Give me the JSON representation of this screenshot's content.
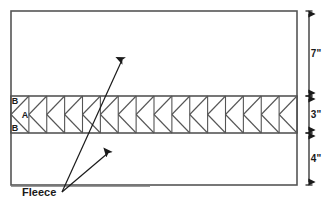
{
  "diagram": {
    "panel": {
      "name": "fabric-panel",
      "left": 11,
      "top": 11,
      "right": 297,
      "bottom": 185,
      "stroke_color": "#555555",
      "fill_color": "#ffffff"
    },
    "band": {
      "name": "zigzag-band",
      "top": 96,
      "bottom": 133,
      "cell_count": 16,
      "stroke_color": "#555555"
    },
    "section_labels": [
      {
        "text": "B",
        "x": 15,
        "y": 104
      },
      {
        "text": "A",
        "x": 25,
        "y": 118
      },
      {
        "text": "B",
        "x": 15,
        "y": 131
      }
    ],
    "dimensions": {
      "line_x": 309,
      "stroke_color": "#1a1a1a",
      "entries": [
        {
          "label": "7\"",
          "top": 11,
          "bottom": 96,
          "text_x": 316,
          "text_y": 57
        },
        {
          "label": "3\"",
          "top": 96,
          "bottom": 133,
          "text_x": 316,
          "text_y": 118
        },
        {
          "label": "4\"",
          "top": 133,
          "bottom": 185,
          "text_x": 316,
          "text_y": 162
        }
      ]
    },
    "callout": {
      "label": "Fleece",
      "text_x": 22,
      "text_y": 196,
      "origin_x": 62,
      "origin_y": 192,
      "underline": {
        "x1": 11,
        "y1": 186,
        "x2": 150,
        "y2": 186
      },
      "leaders": [
        {
          "name": "leader-to-upper-band",
          "x2": 122,
          "y2": 60
        },
        {
          "name": "leader-to-lower-panel",
          "x2": 108,
          "y2": 153
        }
      ],
      "stroke_color": "#1a1a1a"
    }
  }
}
